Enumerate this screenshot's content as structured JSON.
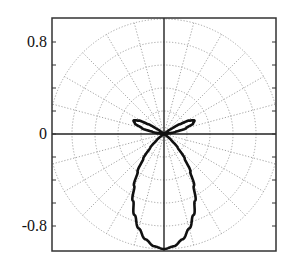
{
  "chart_data": {
    "type": "line",
    "subtype": "polar-beam-pattern",
    "title": "",
    "xlabel": "",
    "ylabel": "",
    "ylim": [
      -1.0,
      1.0
    ],
    "xlim": [
      -0.97,
      0.97
    ],
    "yticks": [
      -0.8,
      -0.6,
      -0.4,
      -0.2,
      0,
      0.2,
      0.4,
      0.6,
      0.8
    ],
    "ytick_labels": [
      {
        "value": 0.8,
        "label": "0.8"
      },
      {
        "value": 0,
        "label": "0"
      },
      {
        "value": -0.8,
        "label": "-0.8"
      }
    ],
    "polar_grid": {
      "circles": [
        0.2,
        0.4,
        0.6,
        0.8,
        1.0
      ],
      "radial_step_deg": 15,
      "style": "dotted",
      "color": "#9a9a9a"
    },
    "axes_lines": {
      "horizontal_y": 0,
      "vertical_x": 0,
      "color": "#222222"
    },
    "series": [
      {
        "name": "beam pattern",
        "color": "#111111",
        "angle_reference": "degrees measured from downward (-y) direction, symmetric left/right",
        "phi_deg": [
          0,
          5,
          10,
          15,
          20,
          25,
          30,
          35,
          40,
          45,
          50,
          55,
          60,
          90,
          95,
          100,
          105,
          110,
          114,
          118,
          122,
          126,
          130,
          180
        ],
        "r": [
          1.0,
          0.98,
          0.93,
          0.85,
          0.75,
          0.64,
          0.52,
          0.4,
          0.28,
          0.17,
          0.08,
          0.02,
          0.0,
          0.0,
          0.02,
          0.1,
          0.2,
          0.27,
          0.29,
          0.25,
          0.16,
          0.07,
          0.01,
          0.0
        ]
      }
    ],
    "grid": true,
    "legend": null
  }
}
